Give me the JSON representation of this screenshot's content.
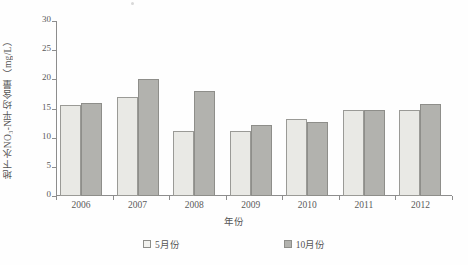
{
  "chart_data": {
    "type": "bar",
    "title": "",
    "xlabel": "年份",
    "ylabel": "地下水NO₃-N平均含量（mg/L）",
    "categories": [
      "2006",
      "2007",
      "2008",
      "2009",
      "2010",
      "2011",
      "2012"
    ],
    "series": [
      {
        "name": "5月份",
        "color": "#e9e9e5",
        "values": [
          15.6,
          16.9,
          11.2,
          11.1,
          13.2,
          14.8,
          14.8
        ]
      },
      {
        "name": "10月份",
        "color": "#b2b2ae",
        "values": [
          15.9,
          20.0,
          18.0,
          12.2,
          12.7,
          14.8,
          15.8
        ]
      }
    ],
    "ylim": [
      0,
      30
    ],
    "yticks": [
      0,
      5,
      10,
      15,
      20,
      25,
      30
    ],
    "ytick_labels": [
      "0",
      "5",
      "10",
      "15",
      "20",
      "25",
      "30"
    ],
    "grid": false,
    "legend_position": "bottom"
  },
  "legend": {
    "items": [
      {
        "label": "5月份"
      },
      {
        "label": "10月份"
      }
    ]
  }
}
